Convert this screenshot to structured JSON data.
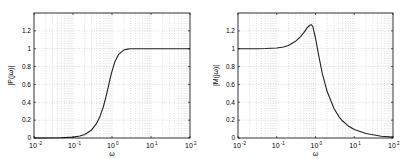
{
  "figure": {
    "background": "#ffffff",
    "line_color": "#222222",
    "grid_color": "#c8c8c8"
  },
  "chart_data": [
    {
      "type": "line",
      "title": "",
      "xlabel": "ω",
      "ylabel": "|P(jω)|",
      "xscale": "log",
      "xlim": [
        0.01,
        100
      ],
      "ylim": [
        0,
        1.4
      ],
      "grid": true,
      "xticks": [
        0.01,
        0.1,
        1,
        10,
        100
      ],
      "xtick_labels": [
        [
          "10",
          "-2"
        ],
        [
          "10",
          "-1"
        ],
        [
          "10",
          "0"
        ],
        [
          "10",
          "1"
        ],
        [
          "10",
          "2"
        ]
      ],
      "yticks": [
        0,
        0.2,
        0.4,
        0.6,
        0.8,
        1,
        1.2
      ],
      "ytick_labels": [
        "0",
        "0.2",
        "0.4",
        "0.6",
        "0.8",
        "1",
        "1.2"
      ],
      "series": [
        {
          "name": "|P(jω)|",
          "x": [
            0.01,
            0.05,
            0.1,
            0.15,
            0.2,
            0.3,
            0.4,
            0.5,
            0.6,
            0.7,
            0.8,
            0.9,
            1.0,
            1.2,
            1.5,
            2.0,
            2.5,
            3.0,
            4.0,
            5.0,
            10,
            20,
            50,
            100
          ],
          "y": [
            0.0,
            0.002,
            0.01,
            0.022,
            0.04,
            0.09,
            0.16,
            0.25,
            0.35,
            0.46,
            0.57,
            0.67,
            0.75,
            0.86,
            0.94,
            0.985,
            0.995,
            0.999,
            1.0,
            1.0,
            1.0,
            1.0,
            1.0,
            1.0
          ]
        }
      ]
    },
    {
      "type": "line",
      "title": "",
      "xlabel": "ω",
      "ylabel": "|M(jω)|",
      "xscale": "log",
      "xlim": [
        0.01,
        100
      ],
      "ylim": [
        0,
        1.4
      ],
      "grid": true,
      "xticks": [
        0.01,
        0.1,
        1,
        10,
        100
      ],
      "xtick_labels": [
        [
          "10",
          "-2"
        ],
        [
          "10",
          "-1"
        ],
        [
          "10",
          "0"
        ],
        [
          "10",
          "1"
        ],
        [
          "10",
          "2"
        ]
      ],
      "yticks": [
        0,
        0.2,
        0.4,
        0.6,
        0.8,
        1,
        1.2
      ],
      "ytick_labels": [
        "0",
        "0.2",
        "0.4",
        "0.6",
        "0.8",
        "1",
        "1.2"
      ],
      "series": [
        {
          "name": "|M(jω)|",
          "x": [
            0.01,
            0.03,
            0.05,
            0.1,
            0.15,
            0.2,
            0.3,
            0.4,
            0.5,
            0.6,
            0.7,
            0.77,
            0.85,
            1.0,
            1.2,
            1.5,
            2.0,
            3.0,
            4.0,
            5.0,
            7.0,
            10,
            20,
            50,
            100
          ],
          "y": [
            1.0,
            1.0,
            1.002,
            1.008,
            1.02,
            1.035,
            1.08,
            1.13,
            1.18,
            1.23,
            1.26,
            1.27,
            1.25,
            1.12,
            0.93,
            0.72,
            0.52,
            0.33,
            0.24,
            0.19,
            0.135,
            0.095,
            0.05,
            0.02,
            0.01
          ]
        }
      ]
    }
  ]
}
